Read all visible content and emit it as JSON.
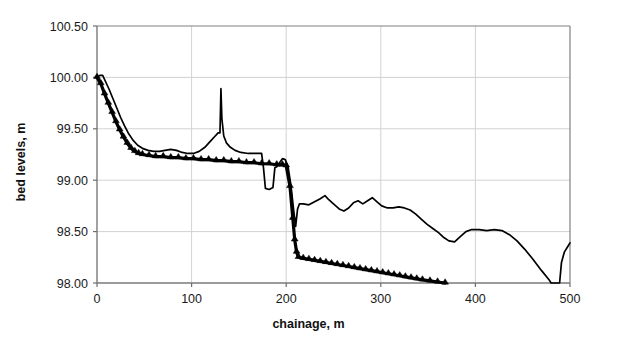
{
  "chart_data": {
    "type": "line",
    "title": "",
    "xlabel": "chainage, m",
    "ylabel": "bed levels, m",
    "xlim": [
      0,
      500
    ],
    "ylim": [
      98.0,
      100.5
    ],
    "xticks": [
      0,
      100,
      200,
      300,
      400,
      500
    ],
    "xtick_labels": [
      "0",
      "100",
      "200",
      "300",
      "400",
      "500"
    ],
    "yticks": [
      98.0,
      98.5,
      99.0,
      99.5,
      100.0,
      100.5
    ],
    "ytick_labels": [
      "98.00",
      "98.50",
      "99.00",
      "99.50",
      "100.00",
      "100.50"
    ],
    "grid": true,
    "legend": "none",
    "series": [
      {
        "name": "measured-bed-profile",
        "style": "thin-line",
        "marker": "none",
        "color": "#000000",
        "points": [
          [
            0,
            100.0
          ],
          [
            3,
            100.02
          ],
          [
            6,
            100.02
          ],
          [
            9,
            99.96
          ],
          [
            13,
            99.88
          ],
          [
            17,
            99.79
          ],
          [
            21,
            99.7
          ],
          [
            25,
            99.61
          ],
          [
            29,
            99.53
          ],
          [
            33,
            99.46
          ],
          [
            38,
            99.39
          ],
          [
            43,
            99.34
          ],
          [
            48,
            99.31
          ],
          [
            54,
            99.29
          ],
          [
            60,
            99.28
          ],
          [
            66,
            99.28
          ],
          [
            72,
            99.29
          ],
          [
            78,
            99.3
          ],
          [
            84,
            99.29
          ],
          [
            90,
            99.27
          ],
          [
            96,
            99.26
          ],
          [
            102,
            99.26
          ],
          [
            108,
            99.28
          ],
          [
            114,
            99.32
          ],
          [
            119,
            99.37
          ],
          [
            124,
            99.42
          ],
          [
            128,
            99.46
          ],
          [
            130,
            99.46
          ],
          [
            131,
            99.89
          ],
          [
            132,
            99.6
          ],
          [
            134,
            99.43
          ],
          [
            137,
            99.36
          ],
          [
            141,
            99.32
          ],
          [
            146,
            99.29
          ],
          [
            152,
            99.27
          ],
          [
            160,
            99.26
          ],
          [
            168,
            99.26
          ],
          [
            174,
            99.26
          ],
          [
            176,
            99.12
          ],
          [
            178,
            98.92
          ],
          [
            182,
            98.91
          ],
          [
            186,
            98.93
          ],
          [
            188,
            99.12
          ],
          [
            190,
            99.13
          ],
          [
            193,
            99.17
          ],
          [
            196,
            99.21
          ],
          [
            199,
            99.2
          ],
          [
            202,
            99.13
          ],
          [
            205,
            98.95
          ],
          [
            208,
            98.7
          ],
          [
            210,
            98.55
          ],
          [
            212,
            98.72
          ],
          [
            214,
            98.77
          ],
          [
            218,
            98.77
          ],
          [
            224,
            98.76
          ],
          [
            230,
            98.79
          ],
          [
            236,
            98.82
          ],
          [
            241,
            98.85
          ],
          [
            245,
            98.81
          ],
          [
            250,
            98.77
          ],
          [
            256,
            98.72
          ],
          [
            261,
            98.7
          ],
          [
            266,
            98.73
          ],
          [
            271,
            98.78
          ],
          [
            276,
            98.8
          ],
          [
            281,
            98.77
          ],
          [
            286,
            98.8
          ],
          [
            291,
            98.83
          ],
          [
            296,
            98.79
          ],
          [
            301,
            98.75
          ],
          [
            307,
            98.73
          ],
          [
            313,
            98.73
          ],
          [
            319,
            98.74
          ],
          [
            325,
            98.73
          ],
          [
            331,
            98.71
          ],
          [
            337,
            98.67
          ],
          [
            343,
            98.62
          ],
          [
            349,
            98.57
          ],
          [
            355,
            98.53
          ],
          [
            361,
            98.49
          ],
          [
            367,
            98.44
          ],
          [
            372,
            98.41
          ],
          [
            378,
            98.4
          ],
          [
            384,
            98.45
          ],
          [
            390,
            98.5
          ],
          [
            396,
            98.52
          ],
          [
            404,
            98.52
          ],
          [
            412,
            98.51
          ],
          [
            420,
            98.52
          ],
          [
            428,
            98.51
          ],
          [
            436,
            98.47
          ],
          [
            444,
            98.41
          ],
          [
            452,
            98.33
          ],
          [
            460,
            98.24
          ],
          [
            470,
            98.12
          ],
          [
            478,
            98.03
          ],
          [
            480,
            98.0
          ],
          [
            483,
            98.0
          ],
          [
            489,
            98.0
          ],
          [
            491,
            98.2
          ],
          [
            494,
            98.3
          ],
          [
            498,
            98.36
          ],
          [
            500,
            98.39
          ]
        ]
      },
      {
        "name": "computed-bed-profile",
        "style": "thick-line-with-triangle-markers",
        "marker": "triangle",
        "color": "#000000",
        "points": [
          [
            0,
            100.0
          ],
          [
            4,
            99.94
          ],
          [
            8,
            99.84
          ],
          [
            12,
            99.75
          ],
          [
            16,
            99.66
          ],
          [
            20,
            99.57
          ],
          [
            24,
            99.49
          ],
          [
            28,
            99.42
          ],
          [
            32,
            99.36
          ],
          [
            36,
            99.31
          ],
          [
            40,
            99.28
          ],
          [
            44,
            99.26
          ],
          [
            48,
            99.25
          ],
          [
            55,
            99.24
          ],
          [
            62,
            99.23
          ],
          [
            70,
            99.23
          ],
          [
            78,
            99.22
          ],
          [
            86,
            99.22
          ],
          [
            94,
            99.21
          ],
          [
            102,
            99.21
          ],
          [
            110,
            99.2
          ],
          [
            118,
            99.2
          ],
          [
            126,
            99.19
          ],
          [
            134,
            99.19
          ],
          [
            142,
            99.18
          ],
          [
            150,
            99.18
          ],
          [
            158,
            99.17
          ],
          [
            166,
            99.17
          ],
          [
            174,
            99.16
          ],
          [
            182,
            99.16
          ],
          [
            190,
            99.15
          ],
          [
            196,
            99.15
          ],
          [
            200,
            99.14
          ],
          [
            204,
            98.94
          ],
          [
            207,
            98.63
          ],
          [
            209,
            98.42
          ],
          [
            211,
            98.3
          ],
          [
            213,
            98.25
          ],
          [
            218,
            98.24
          ],
          [
            224,
            98.23
          ],
          [
            230,
            98.22
          ],
          [
            236,
            98.21
          ],
          [
            242,
            98.2
          ],
          [
            248,
            98.19
          ],
          [
            254,
            98.18
          ],
          [
            260,
            98.17
          ],
          [
            266,
            98.16
          ],
          [
            272,
            98.15
          ],
          [
            278,
            98.14
          ],
          [
            284,
            98.13
          ],
          [
            290,
            98.12
          ],
          [
            296,
            98.11
          ],
          [
            302,
            98.1
          ],
          [
            308,
            98.09
          ],
          [
            314,
            98.08
          ],
          [
            320,
            98.07
          ],
          [
            326,
            98.06
          ],
          [
            332,
            98.05
          ],
          [
            338,
            98.04
          ],
          [
            344,
            98.03
          ],
          [
            352,
            98.02
          ],
          [
            360,
            98.01
          ],
          [
            368,
            98.0
          ]
        ]
      }
    ]
  },
  "axes": {
    "plot_left_px": 97,
    "plot_right_px": 570,
    "plot_top_px": 26,
    "plot_bottom_px": 283
  }
}
